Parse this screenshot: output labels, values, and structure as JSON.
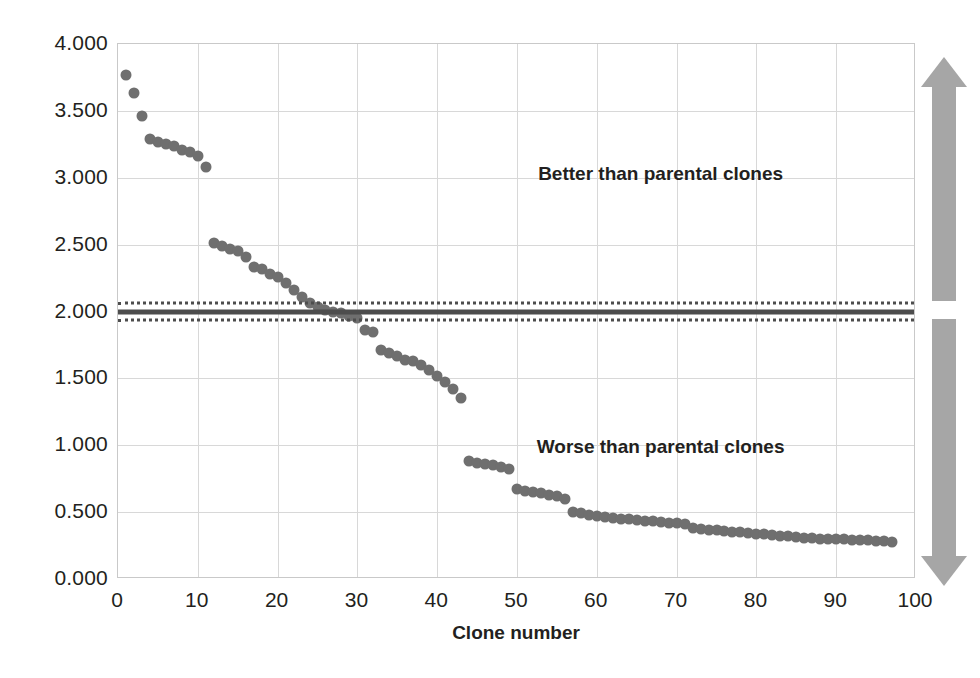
{
  "chart_data": {
    "type": "scatter",
    "title": "",
    "xlabel": "Clone number",
    "ylabel": "Absorbance at 405 nm",
    "xlim": [
      0,
      100
    ],
    "ylim": [
      0,
      4
    ],
    "grid": true,
    "legend_position": "none",
    "marker_color": "#6f6f6f",
    "x_ticks": [
      "0",
      "10",
      "20",
      "30",
      "40",
      "50",
      "60",
      "70",
      "80",
      "90",
      "100"
    ],
    "x_tick_values": [
      0,
      10,
      20,
      30,
      40,
      50,
      60,
      70,
      80,
      90,
      100
    ],
    "y_ticks": [
      "0.000",
      "0.500",
      "1.000",
      "1.500",
      "2.000",
      "2.500",
      "3.000",
      "3.500",
      "4.000"
    ],
    "y_tick_values": [
      0,
      0.5,
      1.0,
      1.5,
      2.0,
      2.5,
      3.0,
      3.5,
      4.0
    ],
    "series": [
      {
        "name": "Clone absorbance",
        "x": [
          1,
          2,
          3,
          4,
          5,
          6,
          7,
          8,
          9,
          10,
          11,
          12,
          13,
          14,
          15,
          16,
          17,
          18,
          19,
          20,
          21,
          22,
          23,
          24,
          25,
          26,
          27,
          28,
          29,
          30,
          31,
          32,
          33,
          34,
          35,
          36,
          37,
          38,
          39,
          40,
          41,
          42,
          43,
          44,
          45,
          46,
          47,
          48,
          49,
          50,
          51,
          52,
          53,
          54,
          55,
          56,
          57,
          58,
          59,
          60,
          61,
          62,
          63,
          64,
          65,
          66,
          67,
          68,
          69,
          70,
          71,
          72,
          73,
          74,
          75,
          76,
          77,
          78,
          79,
          80,
          81,
          82,
          83,
          84,
          85,
          86,
          87,
          88,
          89,
          90,
          91,
          92,
          93,
          94,
          95,
          96,
          97
        ],
        "y": [
          3.77,
          3.63,
          3.46,
          3.29,
          3.27,
          3.25,
          3.24,
          3.21,
          3.19,
          3.16,
          3.08,
          2.51,
          2.49,
          2.47,
          2.45,
          2.41,
          2.33,
          2.32,
          2.28,
          2.26,
          2.21,
          2.16,
          2.11,
          2.06,
          2.03,
          2.01,
          2.0,
          1.99,
          1.97,
          1.95,
          1.86,
          1.85,
          1.71,
          1.69,
          1.67,
          1.64,
          1.63,
          1.6,
          1.56,
          1.52,
          1.47,
          1.42,
          1.35,
          0.88,
          0.87,
          0.86,
          0.85,
          0.84,
          0.82,
          0.67,
          0.66,
          0.65,
          0.64,
          0.63,
          0.62,
          0.6,
          0.5,
          0.49,
          0.48,
          0.47,
          0.46,
          0.455,
          0.45,
          0.445,
          0.44,
          0.435,
          0.43,
          0.425,
          0.42,
          0.415,
          0.41,
          0.385,
          0.375,
          0.37,
          0.365,
          0.36,
          0.355,
          0.35,
          0.345,
          0.34,
          0.335,
          0.33,
          0.325,
          0.32,
          0.315,
          0.31,
          0.305,
          0.3,
          0.3,
          0.3,
          0.3,
          0.295,
          0.29,
          0.29,
          0.285,
          0.285,
          0.28
        ]
      }
    ],
    "reference_lines": [
      {
        "name": "upper-dotted-threshold",
        "value": 2.06,
        "style": "dotted"
      },
      {
        "name": "parental-threshold",
        "value": 2.0,
        "style": "solid"
      },
      {
        "name": "lower-dotted-threshold",
        "value": 1.94,
        "style": "dotted"
      }
    ],
    "annotations": [
      {
        "name": "better-region-label",
        "text": "Better than parental clones",
        "x": 68,
        "y": 3.03
      },
      {
        "name": "worse-region-label",
        "text": "Worse than parental clones",
        "x": 68,
        "y": 0.99
      }
    ],
    "side_indicator": {
      "color": "#a6a6a6",
      "upper_direction": "up",
      "lower_direction": "down"
    }
  }
}
